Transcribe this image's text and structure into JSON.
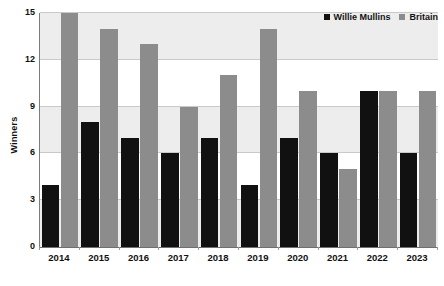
{
  "chart_data": {
    "type": "bar",
    "title": "",
    "xlabel": "",
    "ylabel": "Winners",
    "categories": [
      "2014",
      "2015",
      "2016",
      "2017",
      "2018",
      "2019",
      "2020",
      "2021",
      "2022",
      "2023"
    ],
    "series": [
      {
        "name": "Willie Mullins",
        "color": "#111111",
        "values": [
          4,
          8,
          7,
          6,
          7,
          4,
          7,
          6,
          10,
          6
        ]
      },
      {
        "name": "Britain",
        "color": "#8c8c8c",
        "values": [
          15,
          14,
          13,
          9,
          11,
          14,
          10,
          5,
          10,
          10
        ]
      }
    ],
    "ylim": [
      0,
      15
    ],
    "yticks": [
      "0",
      "3",
      "6",
      "9",
      "12",
      "15"
    ],
    "grid": true,
    "legend_position": "top-right",
    "band_color": "#ededed",
    "background": "#ffffff"
  },
  "legend": {
    "items": [
      {
        "label": "Willie Mullins",
        "swatch": "#111111",
        "icon": "square-swatch-icon"
      },
      {
        "label": "Britain",
        "swatch": "#8c8c8c",
        "icon": "square-swatch-icon"
      }
    ]
  }
}
